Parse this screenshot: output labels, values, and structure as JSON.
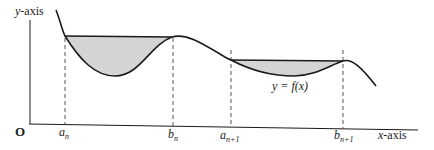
{
  "diagram": {
    "y_axis_label": "y",
    "y_axis_suffix": "-axis",
    "x_axis_label": "x",
    "x_axis_suffix": "-axis",
    "origin_label": "O",
    "function_label": "y = f(x)",
    "points": [
      {
        "base": "a",
        "sub": "n"
      },
      {
        "base": "b",
        "sub": "n"
      },
      {
        "base": "a",
        "sub": "n+1"
      },
      {
        "base": "b",
        "sub": "n+1"
      }
    ],
    "colors": {
      "shade": "#d4d4d4",
      "stroke": "#1a1a1a",
      "dash": "#555555"
    }
  }
}
